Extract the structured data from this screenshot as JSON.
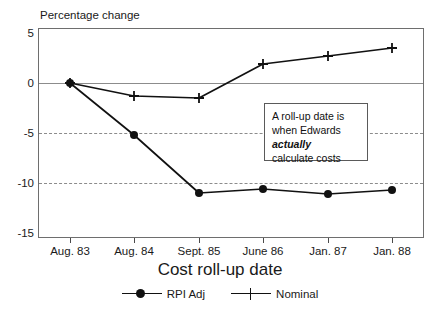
{
  "chart_data": {
    "type": "line",
    "title": "",
    "ylabel": "Percentage change",
    "xlabel": "Cost roll-up date",
    "categories": [
      "Aug. 83",
      "Aug. 84",
      "Sept. 85",
      "June 86",
      "Jan. 87",
      "Jan. 88"
    ],
    "ylim": [
      -15,
      5
    ],
    "yticks": [
      5,
      0,
      -5,
      -10,
      -15
    ],
    "ytick_labels": [
      "5",
      "0",
      "-5",
      "-10",
      "-15"
    ],
    "grid": true,
    "grid_axis": "y",
    "legend_position": "bottom",
    "series": [
      {
        "name": "RPI Adj",
        "marker": "filled-circle",
        "color": "#111111",
        "values": [
          0,
          -5.2,
          -11.0,
          -10.6,
          -11.1,
          -10.7
        ]
      },
      {
        "name": "Nominal",
        "marker": "plus",
        "color": "#111111",
        "values": [
          0,
          -1.3,
          -1.5,
          1.9,
          2.7,
          3.5
        ]
      }
    ],
    "annotations": [
      {
        "name": "roll-up-date-note",
        "line1": "A roll-up date is",
        "line2_prefix": "when Edwards ",
        "line2_emphasis": "actually",
        "line3": "calculate costs"
      }
    ]
  },
  "legend": {
    "items": [
      {
        "label": "RPI Adj",
        "marker": "filled-circle"
      },
      {
        "label": "Nominal",
        "marker": "plus"
      }
    ]
  }
}
